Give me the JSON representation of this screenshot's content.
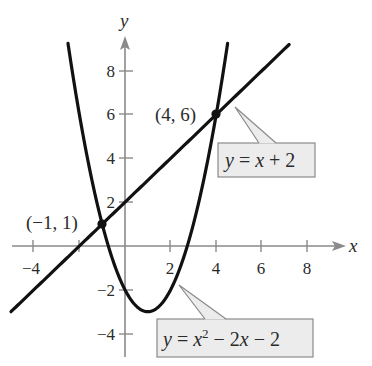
{
  "chart_data": {
    "type": "line",
    "title": "",
    "xlabel": "x",
    "ylabel": "y",
    "xlim": [
      -5,
      9
    ],
    "ylim": [
      -5,
      9.5
    ],
    "grid": false,
    "x_ticks": [
      -4,
      -2,
      2,
      4,
      6,
      8
    ],
    "x_tick_labels": [
      "−4",
      "2",
      "4",
      "6",
      "8"
    ],
    "y_ticks": [
      -4,
      -2,
      2,
      4,
      6,
      8
    ],
    "y_tick_labels": [
      "−4",
      "−2",
      "2",
      "4",
      "6",
      "8"
    ],
    "series": [
      {
        "name": "y = x + 2",
        "kind": "linear",
        "equation": "y = x + 2",
        "x_range": [
          -5,
          7.2
        ],
        "x": [
          -5,
          -4,
          -2,
          -1,
          0,
          2,
          4,
          6,
          7.2
        ],
        "y": [
          -3,
          -2,
          0,
          1,
          2,
          4,
          6,
          8,
          9.2
        ]
      },
      {
        "name": "y = x^2 - 2x - 2",
        "kind": "quadratic",
        "equation": "y = x^2 - 2x - 2",
        "x_range": [
          -2.5,
          4.5
        ],
        "x": [
          -2.5,
          -2,
          -1,
          0,
          1,
          2,
          3,
          4,
          4.5
        ],
        "y": [
          9.25,
          6,
          1,
          -2,
          -3,
          -2,
          1,
          6,
          9.25
        ]
      }
    ],
    "intersection_points": [
      {
        "x": -1,
        "y": 1,
        "label": "(−1, 1)"
      },
      {
        "x": 4,
        "y": 6,
        "label": "(4, 6)"
      }
    ],
    "annotations": [
      {
        "text": "y = x + 2",
        "points_to_series": 0
      },
      {
        "text": "y = x² − 2x − 2",
        "points_to_series": 1
      }
    ]
  },
  "labels": {
    "x_axis": "x",
    "y_axis": "y",
    "ticks_x": {
      "m4": "−4",
      "p2": "2",
      "p4": "4",
      "p6": "6",
      "p8": "8"
    },
    "ticks_y": {
      "m4": "−4",
      "m2": "−2",
      "p2": "2",
      "p4": "4",
      "p6": "6",
      "p8": "8"
    },
    "point_a": "(−1, 1)",
    "point_b": "(4, 6)",
    "line_callout": {
      "y": "y",
      "eq": " = ",
      "x": "x",
      "rest": " + 2"
    },
    "parabola_callout": {
      "y": "y",
      "eq": " = ",
      "x": "x",
      "exp": "2",
      "rest1": " − 2",
      "x2": "x",
      "rest2": " − 2"
    }
  },
  "colors": {
    "curve": "#111111",
    "axis": "#8a8a8a",
    "callout_fill": "#ececec",
    "callout_stroke": "#8a8a8a",
    "text": "#2b2b2b"
  }
}
